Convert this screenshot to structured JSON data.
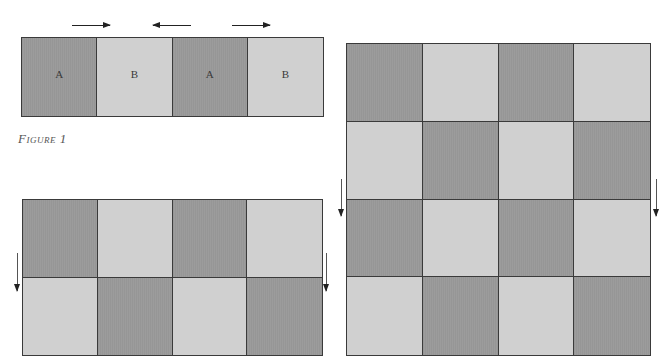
{
  "colors": {
    "dark_cell": "#9c9c9c",
    "light_cell": "#d0d0d0",
    "line": "#3a3a3a"
  },
  "figure1": {
    "caption": "Figure 1",
    "arrows": [
      {
        "direction": "right",
        "left": 72,
        "top": 22,
        "length": 38
      },
      {
        "direction": "left",
        "left": 153,
        "top": 22,
        "length": 38
      },
      {
        "direction": "right",
        "left": 232,
        "top": 22,
        "length": 38
      }
    ],
    "rows": [
      [
        {
          "shade": "dark",
          "label": "A"
        },
        {
          "shade": "light",
          "label": "B"
        },
        {
          "shade": "dark",
          "label": "A"
        },
        {
          "shade": "light",
          "label": "B"
        }
      ]
    ]
  },
  "figure2": {
    "arrows": [
      {
        "direction": "down",
        "left": 14,
        "top": 253,
        "length": 38
      },
      {
        "direction": "down",
        "left": 323,
        "top": 253,
        "length": 38
      }
    ],
    "rows": [
      [
        {
          "shade": "dark"
        },
        {
          "shade": "light"
        },
        {
          "shade": "dark"
        },
        {
          "shade": "light"
        }
      ],
      [
        {
          "shade": "light"
        },
        {
          "shade": "dark"
        },
        {
          "shade": "light"
        },
        {
          "shade": "dark"
        }
      ]
    ]
  },
  "figure3": {
    "arrows": [
      {
        "direction": "down",
        "left": 338,
        "top": 179,
        "length": 37
      },
      {
        "direction": "down",
        "left": 653,
        "top": 179,
        "length": 37
      }
    ],
    "rows": [
      [
        {
          "shade": "dark"
        },
        {
          "shade": "light"
        },
        {
          "shade": "dark"
        },
        {
          "shade": "light"
        }
      ],
      [
        {
          "shade": "light"
        },
        {
          "shade": "dark"
        },
        {
          "shade": "light"
        },
        {
          "shade": "dark"
        }
      ],
      [
        {
          "shade": "dark"
        },
        {
          "shade": "light"
        },
        {
          "shade": "dark"
        },
        {
          "shade": "light"
        }
      ],
      [
        {
          "shade": "light"
        },
        {
          "shade": "dark"
        },
        {
          "shade": "light"
        },
        {
          "shade": "dark"
        }
      ]
    ]
  }
}
